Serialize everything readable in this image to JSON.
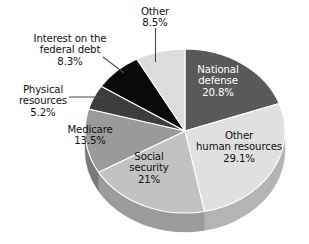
{
  "chart_data": {
    "type": "pie",
    "title": "",
    "subtitle": "",
    "xlabel": "",
    "ylabel": "",
    "legend_position": "none",
    "grid": false,
    "three_d": true,
    "units": "percent",
    "categories": [
      "National defense",
      "Other human resources",
      "Social security",
      "Medicare",
      "Physical resources",
      "Interest on the federal debt",
      "Other"
    ],
    "values": [
      20.8,
      29.1,
      21,
      13.5,
      5.2,
      8.3,
      8.5
    ],
    "value_labels": [
      "20.8%",
      "29.1%",
      "21%",
      "13.5%",
      "5.2%",
      "8.3%",
      "8.5%"
    ],
    "slice_colors": [
      "#595959",
      "#e0e0e0",
      "#c2c2c2",
      "#9a9a9a",
      "#3d3d3d",
      "#0a0a0a",
      "#dcdcdc"
    ],
    "slices": [
      {
        "name": "National defense",
        "label": "National defense",
        "label_line1": "National",
        "label_line2": "defense",
        "value": 20.8,
        "value_label": "20.8%",
        "color": "#595959",
        "side_color": "#3f3f3f",
        "label_placement": "inside",
        "label_text_color": "#ffffff"
      },
      {
        "name": "Other human resources",
        "label": "Other human resources",
        "label_line1": "Other",
        "label_line2": "human resources",
        "value": 29.1,
        "value_label": "29.1%",
        "color": "#e0e0e0",
        "side_color": "#b4b4b4",
        "label_placement": "inside",
        "label_text_color": "#111111"
      },
      {
        "name": "Social security",
        "label": "Social security",
        "label_line1": "Social",
        "label_line2": "security",
        "value": 21,
        "value_label": "21%",
        "color": "#c2c2c2",
        "side_color": "#9b9b9b",
        "label_placement": "inside",
        "label_text_color": "#111111"
      },
      {
        "name": "Medicare",
        "label": "Medicare",
        "label_line1": "Medicare",
        "label_line2": "",
        "value": 13.5,
        "value_label": "13.5%",
        "color": "#9a9a9a",
        "side_color": "#7a7a7a",
        "label_placement": "inside",
        "label_text_color": "#111111"
      },
      {
        "name": "Physical resources",
        "label": "Physical resources",
        "label_line1": "Physical",
        "label_line2": "resources",
        "value": 5.2,
        "value_label": "5.2%",
        "color": "#3d3d3d",
        "side_color": "#2c2c2c",
        "label_placement": "outside-left",
        "label_text_color": "#111111",
        "leader_line": "horizontal"
      },
      {
        "name": "Interest on the federal debt",
        "label": "Interest on the federal debt",
        "label_line1": "Interest on the",
        "label_line2": "federal debt",
        "value": 8.3,
        "value_label": "8.3%",
        "color": "#0a0a0a",
        "side_color": "#000000",
        "label_placement": "outside-upper-left",
        "label_text_color": "#111111",
        "leader_line": "diagonal"
      },
      {
        "name": "Other",
        "label": "Other",
        "label_line1": "Other",
        "label_line2": "",
        "value": 8.5,
        "value_label": "8.5%",
        "color": "#dcdcdc",
        "side_color": "#b0b0b0",
        "label_placement": "outside-top",
        "label_text_color": "#111111",
        "leader_line": "vertical"
      }
    ]
  },
  "labels": {
    "other": {
      "line1": "Other",
      "pct": "8.5%"
    },
    "interest": {
      "line1": "Interest on the",
      "line2": "federal debt",
      "pct": "8.3%"
    },
    "physical": {
      "line1": "Physical",
      "line2": "resources",
      "pct": "5.2%"
    },
    "national": {
      "line1": "National",
      "line2": "defense",
      "pct": "20.8%"
    },
    "otherhuman": {
      "line1": "Other",
      "line2": "human resources",
      "pct": "29.1%"
    },
    "social": {
      "line1": "Social",
      "line2": "security",
      "pct": "21%"
    },
    "medicare": {
      "line1": "Medicare",
      "pct": "13.5%"
    }
  },
  "colors": {
    "background": "#ffffff",
    "text": "#111111",
    "leader_line": "#4a4a4a",
    "slice_national_defense": "#595959",
    "slice_other_human_resources": "#e0e0e0",
    "slice_social_security": "#c2c2c2",
    "slice_medicare": "#9a9a9a",
    "slice_physical_resources": "#3d3d3d",
    "slice_interest_federal_debt": "#0a0a0a",
    "slice_other": "#dcdcdc"
  }
}
